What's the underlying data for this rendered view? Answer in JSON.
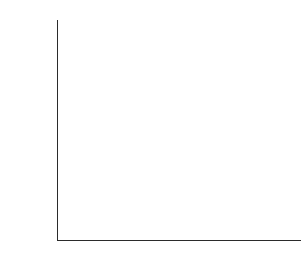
{
  "chart_data": {
    "type": "bar",
    "title": "",
    "subtitle": "",
    "xlabel": "",
    "ylabel": "Mortality rate per 1000 live births",
    "categories": [
      "Sudan",
      "Turkey",
      "Costa Rica",
      "Belgium",
      "Canada"
    ],
    "values": [
      165,
      75,
      25,
      10,
      8
    ],
    "ylim": [
      0,
      200
    ],
    "ytick_labels": [
      "0",
      "50",
      "100",
      "150",
      "200"
    ],
    "ytick_values": [
      0,
      50,
      100,
      150,
      200
    ],
    "yminor_step": 10,
    "grid": false,
    "legend": false,
    "legend_position": "none",
    "bar_fill_color": "#c9c9c9",
    "bar_edge_color": "#3a3a3a",
    "axis_color": "#2b2b2b",
    "background_color": "#ffffff"
  },
  "axes": {
    "y_title": "Mortality rate per 1000 live births",
    "y_labels": [
      "200",
      "150",
      "100",
      "50",
      "0"
    ]
  },
  "categories": {
    "c0": "Sudan",
    "c1": "Turkey",
    "c2": "Costa Rica",
    "c3": "Belgium",
    "c4": "Canada"
  }
}
